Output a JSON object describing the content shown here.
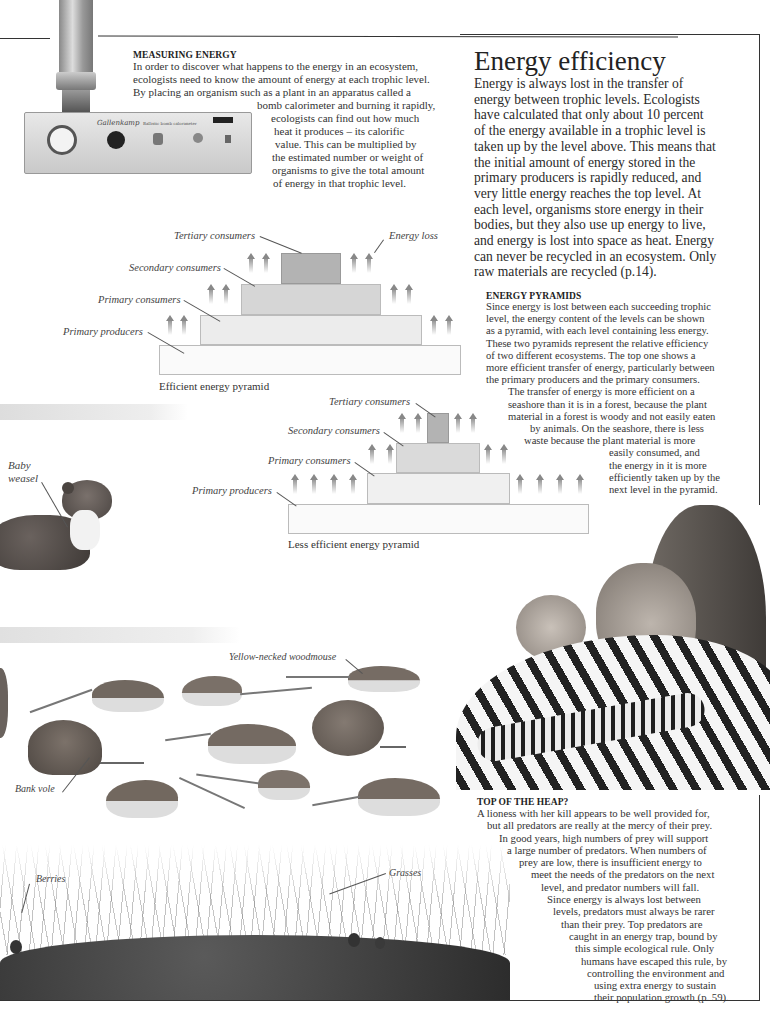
{
  "measuring": {
    "heading": "MEASURING ENERGY",
    "lines": [
      "In order to discover what happens to the energy in an ecosystem,",
      "ecologists need to know the amount of energy at each trophic level.",
      "By placing an organism such as a plant in an apparatus called a",
      "bomb calorimeter and burning it rapidly,",
      "ecologists can find out how much",
      "heat it produces – its calorific",
      "value. This can be multiplied by",
      "the estimated number or weight of",
      "organisms to give the total amount",
      "of energy in that trophic level."
    ],
    "device_brand": "Gallenkamp",
    "device_label": "Ballistic bomb calorimeter"
  },
  "main": {
    "title": "Energy efficiency",
    "lines": [
      "Energy is always lost in the transfer of",
      "energy between trophic levels. Ecologists",
      "have calculated that only about 10 percent",
      "of the energy available in a trophic level is",
      "taken up by the level above. This means that",
      "the initial amount of energy stored in the",
      "primary producers is rapidly reduced, and",
      "very little energy reaches the top level. At",
      "each level, organisms store energy in their",
      "bodies, but they also use up energy to live,",
      "and energy is lost into space as heat. Energy",
      "can never be recycled in an ecosystem. Only",
      "raw materials are recycled (p.14)."
    ]
  },
  "pyramids_text": {
    "heading": "ENERGY PYRAMIDS",
    "lines": [
      "Since energy is lost between each succeeding trophic",
      "level, the energy content of the levels can be shown",
      "as a pyramid, with each level containing less energy.",
      "These two pyramids represent the relative efficiency",
      "of two different ecosystems. The top one shows a",
      "more efficient transfer of energy, particularly between",
      "the primary producers and the primary consumers.",
      "The transfer of energy is more efficient on a",
      "seashore than it is in a forest, because the plant",
      "material in a forest is woody and not easily eaten",
      "by animals. On the seashore, there is less",
      "waste because the plant material is more",
      "easily consumed, and",
      "the energy in it is more",
      "efficiently taken up by the",
      "next level in the pyramid."
    ]
  },
  "pyramid_efficient": {
    "caption": "Efficient energy pyramid",
    "labels": {
      "tertiary": "Tertiary consumers",
      "secondary": "Secondary consumers",
      "primary_consumers": "Primary consumers",
      "producers": "Primary producers",
      "energy_loss": "Energy loss"
    }
  },
  "pyramid_less": {
    "caption": "Less efficient energy pyramid",
    "labels": {
      "tertiary": "Tertiary consumers",
      "secondary": "Secondary consumers",
      "primary_consumers": "Primary consumers",
      "producers": "Primary producers"
    }
  },
  "photo_labels": {
    "weasel": [
      "Baby",
      "weasel"
    ],
    "woodmouse": "Yellow-necked woodmouse",
    "vole": "Bank vole",
    "berries": "Berries",
    "grasses": "Grasses"
  },
  "top_heap": {
    "heading": "TOP OF THE HEAP?",
    "lines": [
      "A lioness with her kill appears to be well provided for,",
      "but all predators are really at the mercy of their prey.",
      "In good years, high numbers of prey will support",
      "a large number of predators. When numbers of",
      "prey are low, there is insufficient energy to",
      "meet the needs of the predators on the next",
      "level, and predator numbers will fall.",
      "Since energy is always lost between",
      "levels, predators must always be rarer",
      "than their prey. Top predators are",
      "caught in an energy trap, bound by",
      "this simple ecological rule. Only",
      "humans have escaped this rule, by",
      "controlling the environment and",
      "using extra energy to sustain",
      "their population growth (p. 59)."
    ]
  },
  "colors": {
    "tertiary_fill": "#b3b3b3",
    "secondary_fill": "#d6d6d6",
    "primary_fill": "#ececec",
    "producers_fill": "#fafafa",
    "rule": "#333333"
  }
}
